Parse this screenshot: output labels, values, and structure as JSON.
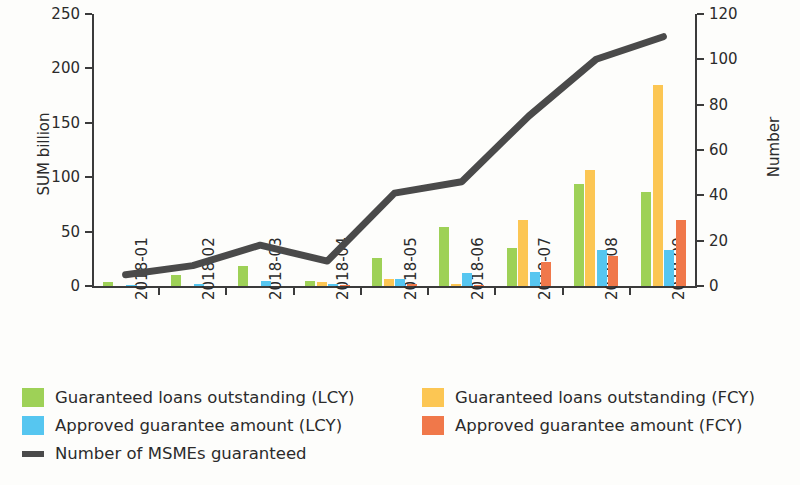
{
  "chart_data": {
    "type": "bar",
    "title": "",
    "subtitle": "",
    "categories": [
      "2018-01",
      "2018-02",
      "2018-03",
      "2018-04",
      "2018-05",
      "2018-06",
      "2018-07",
      "2018-08",
      "2018-09"
    ],
    "xlabel": "",
    "ylabel": "SUM billion",
    "ylabel_secondary": "Number",
    "ylim": [
      0,
      250
    ],
    "ylim_secondary": [
      0,
      120
    ],
    "yticks": [
      0,
      50,
      100,
      150,
      200,
      250
    ],
    "yticks_secondary": [
      0,
      20,
      40,
      60,
      80,
      100,
      120
    ],
    "grid": false,
    "legend_position": "bottom",
    "colors": {
      "guaranteed_loans_lcy": "#9ed157",
      "guaranteed_loans_fcy": "#fcc653",
      "approved_guarantee_lcy": "#56c6f0",
      "approved_guarantee_fcy": "#f0784a",
      "number_of_msmes": "#4a4a4a"
    },
    "series": [
      {
        "name": "Guaranteed loans outstanding (LCY)",
        "type": "bar",
        "axis": "left",
        "color": "#9ed157",
        "values": [
          4,
          10,
          18,
          5,
          26,
          54,
          35,
          94,
          86
        ]
      },
      {
        "name": "Guaranteed loans outstanding (FCY)",
        "type": "bar",
        "axis": "left",
        "color": "#fcc653",
        "values": [
          0,
          0,
          0,
          4,
          6,
          2,
          61,
          107,
          185
        ]
      },
      {
        "name": "Approved guarantee amount (LCY)",
        "type": "bar",
        "axis": "left",
        "color": "#56c6f0",
        "values": [
          1,
          2,
          5,
          2,
          6,
          12,
          13,
          33,
          33
        ]
      },
      {
        "name": "Approved guarantee amount (FCY)",
        "type": "bar",
        "axis": "left",
        "color": "#f0784a",
        "values": [
          0,
          0,
          0,
          1,
          2,
          1,
          22,
          28,
          61
        ]
      },
      {
        "name": "Number of MSMEs guaranteed",
        "type": "line",
        "axis": "right",
        "color": "#4a4a4a",
        "values": [
          5,
          9,
          18,
          11,
          41,
          46,
          75,
          100,
          110
        ]
      }
    ]
  },
  "axes": {
    "left_title": "SUM billion",
    "right_title": "Number",
    "left_ticks": [
      "0",
      "50",
      "100",
      "150",
      "200",
      "250"
    ],
    "right_ticks": [
      "0",
      "20",
      "40",
      "60",
      "80",
      "100",
      "120"
    ],
    "x_ticks": [
      "2018-01",
      "2018-02",
      "2018-03",
      "2018-04",
      "2018-05",
      "2018-06",
      "2018-07",
      "2018-08",
      "2018-09"
    ]
  },
  "legend": {
    "items": [
      {
        "label": "Guaranteed loans outstanding (LCY)",
        "swatch": "green",
        "kind": "box"
      },
      {
        "label": "Guaranteed loans outstanding (FCY)",
        "swatch": "yellow",
        "kind": "box"
      },
      {
        "label": "Approved guarantee amount (LCY)",
        "swatch": "blue",
        "kind": "box"
      },
      {
        "label": "Approved guarantee amount (FCY)",
        "swatch": "red",
        "kind": "box"
      },
      {
        "label": "Number of MSMEs guaranteed",
        "swatch": "line",
        "kind": "line"
      }
    ]
  }
}
